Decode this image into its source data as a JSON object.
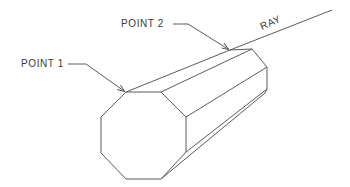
{
  "diagram": {
    "labels": {
      "point1": "POINT 1",
      "point2": "POINT 2",
      "ray": "RAY"
    },
    "colors": {
      "line": "#5a5a5a",
      "text": "#3a3a3a",
      "background": "#ffffff"
    },
    "points": {
      "point1": [
        126,
        92
      ],
      "point2": [
        230,
        50
      ],
      "ray_end": [
        332,
        10
      ]
    }
  }
}
